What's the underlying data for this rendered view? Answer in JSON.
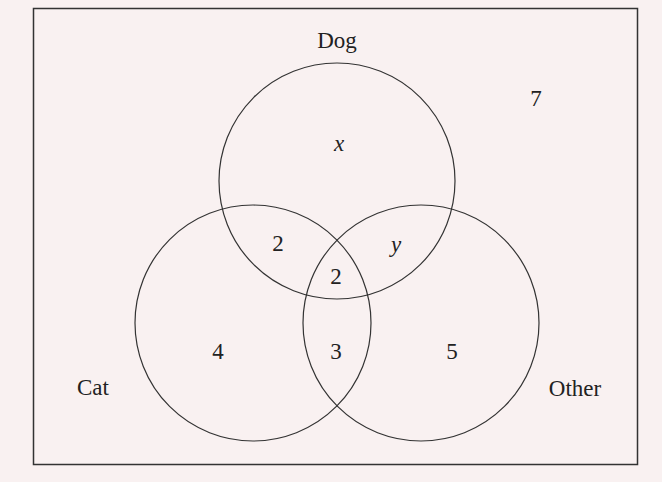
{
  "diagram": {
    "type": "venn",
    "sets": {
      "dog": {
        "label": "Dog"
      },
      "cat": {
        "label": "Cat"
      },
      "other": {
        "label": "Other"
      }
    },
    "regions": {
      "dog_only": "x",
      "cat_and_dog_only": "2",
      "dog_and_other_only": "y",
      "all_three": "2",
      "cat_only": "4",
      "cat_and_other_only": "3",
      "other_only": "5",
      "none": "7"
    },
    "colors": {
      "background": "#f9f1f1",
      "stroke": "#333333",
      "text": "#222222"
    }
  }
}
